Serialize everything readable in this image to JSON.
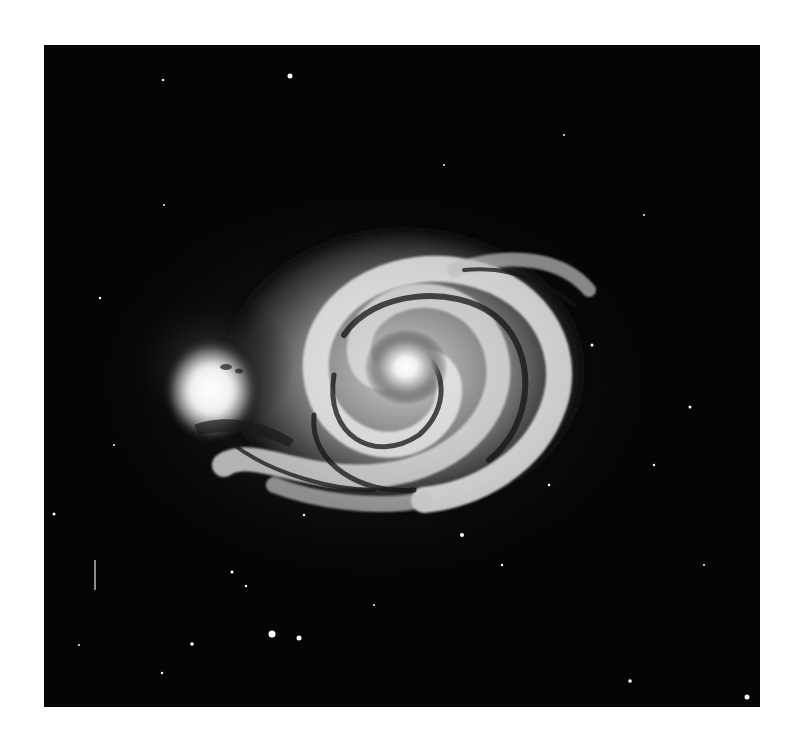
{
  "image": {
    "subject": "spiral galaxy with companion galaxy",
    "colors": {
      "background": "#ffffff",
      "sky": "#050505",
      "core": "#ffffff",
      "arm": "#e6e6e6",
      "dust": "#1a1a1a"
    },
    "frame": {
      "left": 44,
      "top": 45,
      "width": 716,
      "height": 662
    },
    "main_galaxy": {
      "cx": 360,
      "cy": 325,
      "rx": 175,
      "ry": 140
    },
    "companion": {
      "cx": 170,
      "cy": 345,
      "rx": 40,
      "ry": 45
    },
    "stars": [
      {
        "x": 246,
        "y": 31,
        "r": 2.5
      },
      {
        "x": 119,
        "y": 35,
        "r": 1.2
      },
      {
        "x": 255,
        "y": 593,
        "r": 2.5
      },
      {
        "x": 228,
        "y": 589,
        "r": 3.5
      },
      {
        "x": 148,
        "y": 599,
        "r": 1.8
      },
      {
        "x": 118,
        "y": 628,
        "r": 1.2
      },
      {
        "x": 188,
        "y": 527,
        "r": 1.5
      },
      {
        "x": 202,
        "y": 541,
        "r": 1.2
      },
      {
        "x": 10,
        "y": 469,
        "r": 1.5
      },
      {
        "x": 703,
        "y": 652,
        "r": 2.5
      },
      {
        "x": 586,
        "y": 636,
        "r": 1.8
      },
      {
        "x": 646,
        "y": 362,
        "r": 1.5
      },
      {
        "x": 418,
        "y": 490,
        "r": 2
      },
      {
        "x": 458,
        "y": 520,
        "r": 1.2
      },
      {
        "x": 56,
        "y": 253,
        "r": 1.2
      },
      {
        "x": 120,
        "y": 160,
        "r": 1
      },
      {
        "x": 400,
        "y": 120,
        "r": 1
      },
      {
        "x": 520,
        "y": 90,
        "r": 1
      },
      {
        "x": 600,
        "y": 170,
        "r": 1
      },
      {
        "x": 610,
        "y": 420,
        "r": 1.2
      },
      {
        "x": 660,
        "y": 520,
        "r": 1
      },
      {
        "x": 330,
        "y": 560,
        "r": 1
      },
      {
        "x": 70,
        "y": 400,
        "r": 1
      },
      {
        "x": 260,
        "y": 470,
        "r": 1.2
      },
      {
        "x": 505,
        "y": 440,
        "r": 1.2
      },
      {
        "x": 548,
        "y": 300,
        "r": 1.5
      },
      {
        "x": 35,
        "y": 600,
        "r": 1
      }
    ],
    "streak": {
      "x": 51,
      "y": 515,
      "length": 30
    }
  }
}
